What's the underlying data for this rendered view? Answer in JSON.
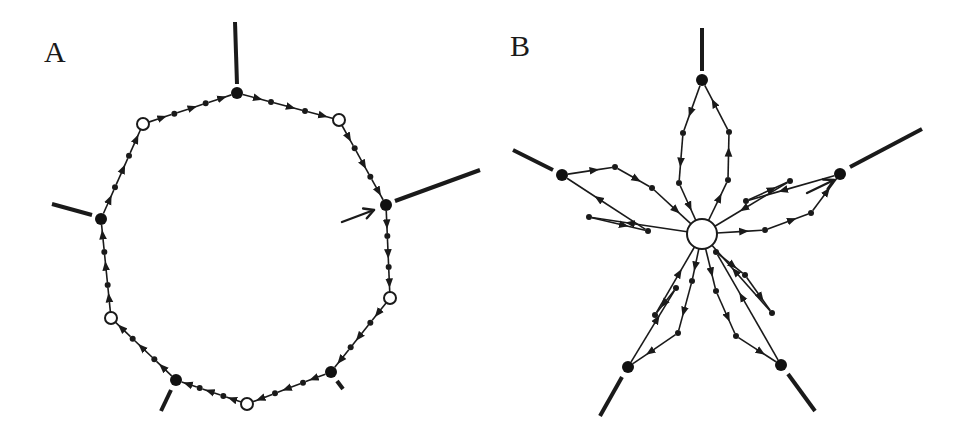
{
  "panels": [
    {
      "id": "A",
      "label": "A",
      "label_pos": [
        44,
        62
      ],
      "layout": "ring",
      "colors": {
        "ink": "#1a1a1a",
        "background": "#ffffff"
      },
      "ring_nodes": [
        {
          "type": "filled",
          "x": 237,
          "y": 93,
          "r": 6
        },
        {
          "type": "open",
          "x": 339,
          "y": 120,
          "r": 6
        },
        {
          "type": "filled",
          "x": 386,
          "y": 205,
          "r": 6
        },
        {
          "type": "open",
          "x": 390,
          "y": 298,
          "r": 6
        },
        {
          "type": "filled",
          "x": 331,
          "y": 372,
          "r": 6
        },
        {
          "type": "open",
          "x": 247,
          "y": 404,
          "r": 6
        },
        {
          "type": "filled",
          "x": 176,
          "y": 380,
          "r": 6
        },
        {
          "type": "open",
          "x": 111,
          "y": 318,
          "r": 6
        },
        {
          "type": "filled",
          "x": 101,
          "y": 219,
          "r": 6
        },
        {
          "type": "open",
          "x": 143,
          "y": 124,
          "r": 6
        }
      ],
      "stubs": [
        {
          "x1": 237,
          "y1": 84,
          "x2": 235,
          "y2": 22
        },
        {
          "x1": 395,
          "y1": 201,
          "x2": 480,
          "y2": 170
        },
        {
          "x1": 92,
          "y1": 215,
          "x2": 52,
          "y2": 204
        },
        {
          "x1": 171,
          "y1": 390,
          "x2": 161,
          "y2": 411
        },
        {
          "x1": 337,
          "y1": 381,
          "x2": 343,
          "y2": 389
        }
      ],
      "pointer": {
        "from": [
          342,
          222
        ],
        "to": [
          374,
          210
        ]
      }
    },
    {
      "id": "B",
      "label": "B",
      "label_pos": [
        510,
        56
      ],
      "layout": "star",
      "center": {
        "type": "open",
        "x": 702,
        "y": 234,
        "r": 15
      },
      "outer_nodes": [
        {
          "type": "filled",
          "x": 702,
          "y": 80,
          "r": 6
        },
        {
          "type": "filled",
          "x": 840,
          "y": 174,
          "r": 6
        },
        {
          "type": "filled",
          "x": 781,
          "y": 365,
          "r": 6
        },
        {
          "type": "filled",
          "x": 628,
          "y": 367,
          "r": 6
        },
        {
          "type": "filled",
          "x": 562,
          "y": 175,
          "r": 6
        }
      ],
      "petals": [
        {
          "out": [
            [
              683,
              133
            ],
            [
              679,
              183
            ]
          ],
          "in": [
            [
              728,
              180
            ],
            [
              729,
              132
            ]
          ]
        },
        {
          "out": [
            [
              746,
              201
            ],
            [
              790,
              181
            ]
          ],
          "in": [
            [
              765,
              230
            ],
            [
              811,
              213
            ]
          ]
        },
        {
          "out": [
            [
              716,
              252
            ],
            [
              745,
              275
            ],
            [
              772,
              313
            ]
          ],
          "in": [
            [
              716,
              291
            ],
            [
              736,
              336
            ]
          ]
        },
        {
          "out": [
            [
              676,
              288
            ],
            [
              655,
              315
            ]
          ],
          "in": [
            [
              692,
              281
            ],
            [
              678,
              333
            ]
          ]
        },
        {
          "out": [
            [
              615,
              167
            ],
            [
              652,
              188
            ]
          ],
          "in": [
            [
              589,
              217
            ],
            [
              648,
              231
            ]
          ]
        }
      ],
      "stubs": [
        {
          "x1": 702,
          "y1": 71,
          "x2": 702,
          "y2": 28
        },
        {
          "x1": 850,
          "y1": 167,
          "x2": 922,
          "y2": 129
        },
        {
          "x1": 788,
          "y1": 374,
          "x2": 815,
          "y2": 411
        },
        {
          "x1": 622,
          "y1": 377,
          "x2": 600,
          "y2": 416
        },
        {
          "x1": 553,
          "y1": 170,
          "x2": 513,
          "y2": 150
        }
      ],
      "pointer": {
        "from": [
          807,
          193
        ],
        "to": [
          834,
          180
        ]
      }
    }
  ]
}
